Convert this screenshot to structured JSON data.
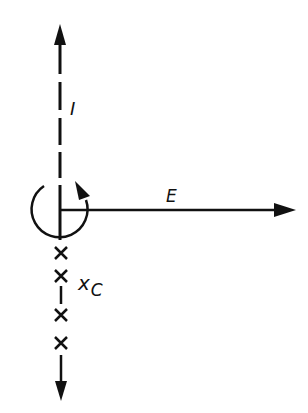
{
  "diagram": {
    "labels": {
      "current": "I",
      "field": "E",
      "position_main": "x",
      "position_sub": "C"
    },
    "stroke_color": "#111111",
    "background": "#ffffff",
    "elements": [
      {
        "name": "vertical-axis",
        "description": "dashed vertical line with upward arrow (I) and downward arrow"
      },
      {
        "name": "circulation-arc",
        "description": "circular arrow around origin, counterclockwise"
      },
      {
        "name": "field-arrow",
        "description": "horizontal arrow pointing right labeled E"
      },
      {
        "name": "cross-marks",
        "count": 4,
        "description": "x marks along lower axis, labeled x_C"
      }
    ]
  }
}
